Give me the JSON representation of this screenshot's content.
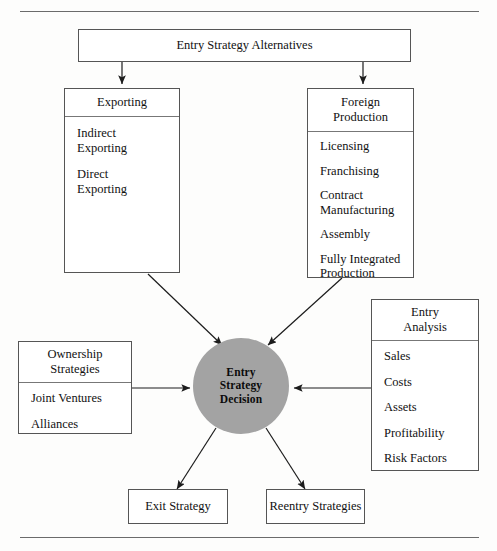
{
  "diagram": {
    "title": "Entry Strategy Alternatives",
    "accent_gray": "#a3a3a3",
    "line_color": "#555555"
  },
  "top": {
    "label": "Entry Strategy Alternatives"
  },
  "exporting": {
    "header": "Exporting",
    "items": [
      "Indirect\nExporting",
      "Direct\nExporting"
    ]
  },
  "foreign_production": {
    "header": "Foreign\nProduction",
    "items": [
      "Licensing",
      "Franchising",
      "Contract\nManufacturing",
      "Assembly",
      "Fully Integrated\nProduction"
    ]
  },
  "ownership": {
    "header": "Ownership\nStrategies",
    "items": [
      "Joint Ventures",
      "Alliances"
    ]
  },
  "entry_analysis": {
    "header": "Entry\nAnalysis",
    "items": [
      "Sales",
      "Costs",
      "Assets",
      "Profitability",
      "Risk Factors"
    ]
  },
  "decision": {
    "label": "Entry\nStrategy\nDecision"
  },
  "outcomes": {
    "exit": "Exit Strategy",
    "reentry": "Reentry Strategies"
  }
}
